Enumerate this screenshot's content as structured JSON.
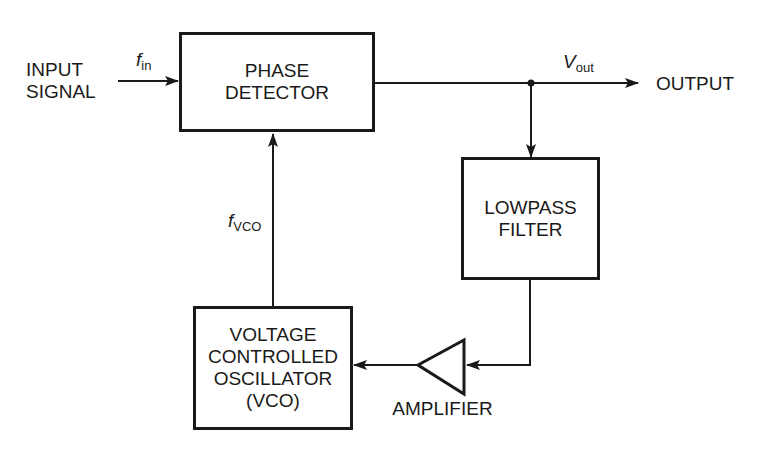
{
  "diagram": {
    "blocks": {
      "phase_detector": {
        "line1": "PHASE",
        "line2": "DETECTOR"
      },
      "lowpass_filter": {
        "line1": "LOWPASS",
        "line2": "FILTER"
      },
      "vco": {
        "line1": "VOLTAGE",
        "line2": "CONTROLLED",
        "line3": "OSCILLATOR",
        "line4": "(VCO)"
      },
      "amplifier": {
        "label": "AMPLIFIER"
      }
    },
    "labels": {
      "input_line1": "INPUT",
      "input_line2": "SIGNAL",
      "output": "OUTPUT",
      "f_in_main": "f",
      "f_in_sub": "in",
      "v_out_main": "V",
      "v_out_sub": "out",
      "f_vco_main": "f",
      "f_vco_sub": "VCO"
    },
    "colors": {
      "stroke": "#1a1a1a",
      "background": "#ffffff"
    }
  }
}
